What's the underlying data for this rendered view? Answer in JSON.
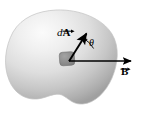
{
  "figure": {
    "name": "magnetic-flux-area-element-diagram",
    "background_color": "#ffffff",
    "width": 147,
    "height": 115,
    "surface": {
      "name": "shaded-blob-surface",
      "fill_light": "#f2f2f2",
      "fill_mid": "#d9d9d9",
      "fill_dark": "#a8a8a8",
      "outline_color": "#bfbfbf"
    },
    "area_patch": {
      "name": "area-element-patch",
      "fill": "#8c8c8c",
      "stroke": "#6e6e6e"
    }
  },
  "labels": {
    "area_vector": {
      "italic_prefix": "d",
      "symbol": "A",
      "full_text": "dA",
      "has_vector_arrow": true
    },
    "field_vector": {
      "symbol": "B",
      "full_text": "B",
      "has_vector_arrow": true
    },
    "angle": {
      "symbol": "θ",
      "full_text": "θ"
    }
  },
  "vectors": {
    "area_vector_arrow": {
      "name": "area-vector-arrow",
      "color": "#000000",
      "x1": 69,
      "y1": 61,
      "x2": 88.5,
      "y2": 30.5
    },
    "field_vector_arrow": {
      "name": "field-vector-arrow",
      "color": "#000000",
      "x1": 69,
      "y1": 61,
      "x2": 134,
      "y2": 61
    },
    "angle_arc": {
      "name": "angle-arc",
      "color": "#000000",
      "radius": 27
    }
  }
}
